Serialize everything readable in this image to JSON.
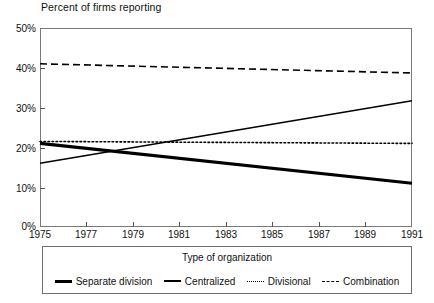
{
  "chart_data": {
    "type": "line",
    "title": "Percent of firms reporting",
    "xlabel": "",
    "ylabel": "",
    "xlim": [
      1975,
      1991
    ],
    "ylim": [
      0,
      50
    ],
    "ytick_labels": [
      "0%",
      "10%",
      "20%",
      "30%",
      "40%",
      "50%"
    ],
    "ytick_values": [
      0,
      10,
      20,
      30,
      40,
      50
    ],
    "xtick_labels": [
      "1975",
      "1977",
      "1979",
      "1981",
      "1983",
      "1985",
      "1987",
      "1989",
      "1991"
    ],
    "xtick_values": [
      1975,
      1977,
      1979,
      1981,
      1983,
      1985,
      1987,
      1989,
      1991
    ],
    "x": [
      1975,
      1991
    ],
    "grid": false,
    "legend_position": "bottom",
    "legend_title": "Type of organization",
    "series": [
      {
        "name": "Separate division",
        "style": "solid-thick",
        "values": [
          21.0,
          11.0
        ]
      },
      {
        "name": "Centralized",
        "style": "solid-thin",
        "values": [
          16.0,
          31.7
        ]
      },
      {
        "name": "Divisional",
        "style": "dotted",
        "values": [
          21.5,
          21.0
        ]
      },
      {
        "name": "Combination",
        "style": "dashed",
        "values": [
          41.0,
          38.7
        ]
      }
    ]
  },
  "legend": {
    "title": "Type of organization",
    "items": [
      {
        "label": "Separate division",
        "swatch": "line-solid-thick-icon"
      },
      {
        "label": "Centralized",
        "swatch": "line-solid-thin-icon"
      },
      {
        "label": "Divisional",
        "swatch": "line-dotted-icon"
      },
      {
        "label": "Combination",
        "swatch": "line-dashed-icon"
      }
    ]
  },
  "colors": {
    "ink": "#000000",
    "frame": "#7a7a7a",
    "background": "#ffffff"
  }
}
